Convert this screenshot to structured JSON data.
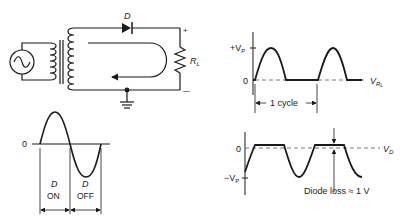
{
  "circuit": {
    "diode_label": "D",
    "resistor_label": "R",
    "resistor_sub": "L",
    "plus_sign": "+",
    "minus_sign": "—"
  },
  "input_wave": {
    "zero_label": "0",
    "on_label_d": "D",
    "on_label": "ON",
    "off_label_d": "D",
    "off_label": "OFF"
  },
  "output_rl": {
    "vp_label": "+V",
    "vp_sub": "P",
    "zero_label": "0",
    "signal_label": "V",
    "signal_sub": "R",
    "signal_sub2": "L",
    "cycle_label": "1 cycle"
  },
  "output_d": {
    "zero_label": "0",
    "neg_vp_label": "−V",
    "neg_vp_sub": "P",
    "signal_label": "V",
    "signal_sub": "D",
    "loss_label": "Diode loss ≈ 1 V"
  },
  "colors": {
    "ink": "#1a1a1a",
    "dash": "#555555",
    "background": "#ffffff"
  }
}
